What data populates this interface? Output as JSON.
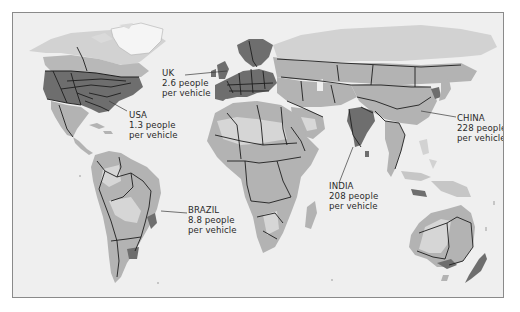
{
  "map": {
    "title": "People per vehicle by country",
    "colors": {
      "sea": "#efefef",
      "land_light": "#dadada",
      "land_mid": "#b3b3b3",
      "land_midlight": "#c6c6c6",
      "land_dark": "#6e6e6e",
      "border": "#1e1e1e",
      "ice": "#f6f6f6"
    },
    "callouts": [
      {
        "id": "usa",
        "country": "USA",
        "value": "1.3 people",
        "unit": "per vehicle"
      },
      {
        "id": "uk",
        "country": "UK",
        "value": "2.6 people",
        "unit": "per vehicle"
      },
      {
        "id": "china",
        "country": "CHINA",
        "value": "228 people",
        "unit": "per vehicle"
      },
      {
        "id": "india",
        "country": "INDIA",
        "value": "208 people",
        "unit": "per vehicle"
      },
      {
        "id": "brazil",
        "country": "BRAZIL",
        "value": "8.8 people",
        "unit": "per vehicle"
      }
    ]
  }
}
